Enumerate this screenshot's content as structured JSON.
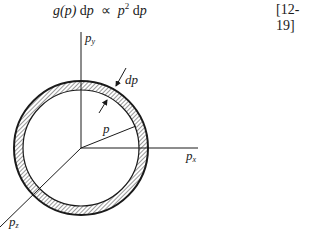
{
  "equation": {
    "lhs_func": "g(p)",
    "lhs_diff": "d",
    "lhs_var": "p",
    "relation": "∝",
    "rhs_base": "p",
    "rhs_exp": "2",
    "rhs_diff": "d",
    "rhs_var": "p",
    "tag": "[12-19]"
  },
  "diagram": {
    "axes": {
      "y_label": "p",
      "y_sub": "y",
      "x_label": "p",
      "x_sub": "x",
      "z_label": "p",
      "z_sub": "z"
    },
    "radius_label": "p",
    "shell_label": "dp",
    "colors": {
      "ink": "#1a1a1a",
      "background": "#ffffff"
    }
  }
}
